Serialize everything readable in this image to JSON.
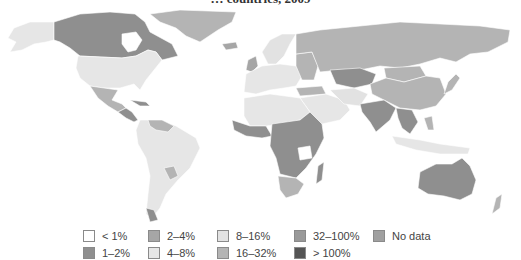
{
  "title": "… countries, 2009",
  "legend": {
    "items": [
      {
        "label": "< 1%",
        "color": "#ffffff",
        "col": 0,
        "row": 0
      },
      {
        "label": "1–2%",
        "color": "#8f8f8f",
        "col": 0,
        "row": 1
      },
      {
        "label": "2–4%",
        "color": "#a6a6a6",
        "col": 1,
        "row": 0
      },
      {
        "label": "4–8%",
        "color": "#e6e6e6",
        "col": 1,
        "row": 1
      },
      {
        "label": "8–16%",
        "color": "#e2e2e2",
        "col": 2,
        "row": 0
      },
      {
        "label": "16–32%",
        "color": "#b4b4b4",
        "col": 2,
        "row": 1
      },
      {
        "label": "32–100%",
        "color": "#999999",
        "col": 3,
        "row": 0
      },
      {
        "label": "> 100%",
        "color": "#555555",
        "col": 3,
        "row": 1
      },
      {
        "label": "No data",
        "color": "#a0a0a0",
        "col": 4,
        "row": 0
      }
    ]
  },
  "regions": [
    {
      "name": "Greenland",
      "class": "16–32%"
    },
    {
      "name": "Canada",
      "class": "1–2%"
    },
    {
      "name": "Alaska / United States",
      "class": "4–8%"
    },
    {
      "name": "Mexico",
      "class": "16–32%"
    },
    {
      "name": "South America",
      "class": "4–8%"
    },
    {
      "name": "Russia",
      "class": "16–32%"
    },
    {
      "name": "Kazakhstan",
      "class": "1–2%"
    },
    {
      "name": "China",
      "class": "16–32%"
    },
    {
      "name": "India",
      "class": "1–2%"
    },
    {
      "name": "Central Africa",
      "class": "1–2%"
    },
    {
      "name": "Southern Africa",
      "class": "16–32%"
    },
    {
      "name": "Madagascar",
      "class": "1–2%"
    },
    {
      "name": "Australia",
      "class": "1–2%"
    },
    {
      "name": "Indonesia",
      "class": "4–8%"
    },
    {
      "name": "Western Europe",
      "class": "4–8%"
    },
    {
      "name": "Middle East",
      "class": "4–8%"
    }
  ]
}
